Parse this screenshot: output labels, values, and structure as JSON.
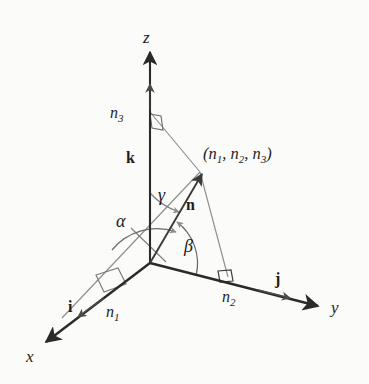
{
  "figure": {
    "kind": "3d-direction-angles-diagram",
    "background_color": "#fbfbfa",
    "ink_color": "#1d1d1d",
    "axis_color": "#2a2a2a",
    "construction_color": "#8d8d8d",
    "vector_color": "#3a3a3a"
  },
  "axes": {
    "x_label": "x",
    "y_label": "y",
    "z_label": "z"
  },
  "unit_vectors": {
    "i_label": "i",
    "j_label": "j",
    "k_label": "k"
  },
  "vector": {
    "n_label": "n",
    "point_open": "(",
    "point_n1": "n",
    "point_n1_sub": "1",
    "point_sep1": ", ",
    "point_n2": "n",
    "point_n2_sub": "2",
    "point_sep2": ", ",
    "point_n3": "n",
    "point_n3_sub": "3",
    "point_close": ")"
  },
  "components": {
    "n1": "n",
    "n1_sub": "1",
    "n2": "n",
    "n2_sub": "2",
    "n3": "n",
    "n3_sub": "3"
  },
  "angles": {
    "alpha": "α",
    "beta": "β",
    "gamma": "γ"
  },
  "geometry": {
    "origin": [
      150,
      263
    ],
    "z_axis_tip": [
      150,
      48
    ],
    "y_axis_tip": [
      322,
      308
    ],
    "x_axis_tip": [
      42,
      345
    ],
    "point": [
      200,
      172
    ],
    "z_foot": [
      150,
      112
    ],
    "y_foot": [
      228,
      277
    ],
    "x_foot": [
      103,
      288
    ]
  }
}
